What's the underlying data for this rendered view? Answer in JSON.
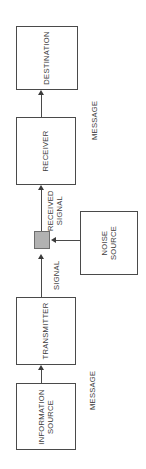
{
  "diagram": {
    "orientation": "rotated-90-ccw",
    "background_color": "#ffffff",
    "line_color": "#4a4a4a",
    "text_color": "#3b3b3b",
    "channel_fill_color": "#b2b2b2"
  },
  "blocks": {
    "destination": {
      "label": "DESTINATION"
    },
    "receiver": {
      "label": "RECEIVER"
    },
    "channel": {
      "label": ""
    },
    "noise_source": {
      "label": "NOISE\nSOURCE"
    },
    "transmitter": {
      "label": "TRANSMITTER"
    },
    "information_source": {
      "label": "INFORMATION\nSOURCE"
    }
  },
  "edge_labels": {
    "message_top": "MESSAGE",
    "received_signal": "RECEIVED\nSIGNAL",
    "signal": "SIGNAL",
    "message_bottom": "MESSAGE"
  }
}
